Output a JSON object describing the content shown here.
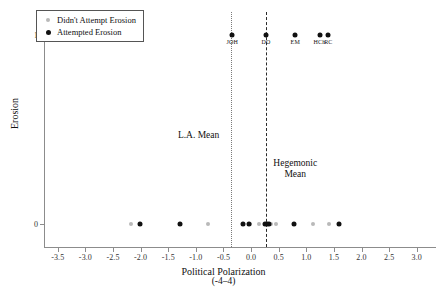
{
  "chart_data": {
    "type": "scatter",
    "title": "",
    "xlabel": "Political Polarization",
    "xlabel_sub": "(-4–4)",
    "ylabel": "Erosion",
    "xlim": [
      -3.75,
      3.15
    ],
    "ylim": [
      -0.12,
      1.12
    ],
    "grid": false,
    "xticks": [
      -3.5,
      -3.0,
      -2.5,
      -2.0,
      -1.5,
      -1.0,
      -0.5,
      0.0,
      0.5,
      1.0,
      1.5,
      2.0,
      2.5,
      3.0
    ],
    "xticklabels": [
      "-3.5",
      "-3.0",
      "-2.5",
      "-2.0",
      "-1.5",
      "-1.0",
      "-0.5",
      "0.0",
      "0.5",
      "1.0",
      "1.5",
      "2.0",
      "2.5",
      "3.0"
    ],
    "yticks": [
      0,
      1
    ],
    "yticklabels": [
      "0",
      "1"
    ],
    "legend_position": "upper-left",
    "series": [
      {
        "name": "Didn't Attempt Erosion",
        "marker": "small-gray-dot",
        "color": "#b9b9b9",
        "points": [
          {
            "x": -2.17,
            "y": 0
          },
          {
            "x": -0.78,
            "y": 0
          },
          {
            "x": -0.02,
            "y": 0
          },
          {
            "x": 0.15,
            "y": 0
          },
          {
            "x": 0.37,
            "y": 0
          },
          {
            "x": 0.46,
            "y": 0
          },
          {
            "x": 1.12,
            "y": 0
          },
          {
            "x": 1.42,
            "y": 0
          }
        ]
      },
      {
        "name": "Attempted Erosion",
        "marker": "black-dot",
        "color": "#111111",
        "points": [
          {
            "x": -2.02,
            "y": 0,
            "label": ""
          },
          {
            "x": -1.29,
            "y": 0,
            "label": ""
          },
          {
            "x": -0.15,
            "y": 0,
            "label": ""
          },
          {
            "x": -0.04,
            "y": 0,
            "label": ""
          },
          {
            "x": 0.25,
            "y": 0,
            "label": ""
          },
          {
            "x": 0.29,
            "y": 0,
            "label": ""
          },
          {
            "x": 0.32,
            "y": 0,
            "label": ""
          },
          {
            "x": 0.78,
            "y": 0,
            "label": ""
          },
          {
            "x": 1.59,
            "y": 0,
            "label": ""
          },
          {
            "x": -0.34,
            "y": 1,
            "label": "JOH"
          },
          {
            "x": 0.27,
            "y": 1,
            "label": "DO"
          },
          {
            "x": 0.8,
            "y": 1,
            "label": "EM"
          },
          {
            "x": 1.24,
            "y": 1,
            "label": "HCh"
          },
          {
            "x": 1.4,
            "y": 1,
            "label": "RC"
          }
        ]
      }
    ],
    "reference_lines": [
      {
        "name": "L.A. Mean",
        "x": -0.37,
        "style": "dotted",
        "color": "#7a7a7a",
        "annotation": "L.A. Mean",
        "annotation_x": -0.95,
        "annotation_y": 0.47
      },
      {
        "name": "Hegemonic Mean",
        "x": 0.27,
        "style": "dashed",
        "color": "#2a2a2a",
        "annotation": "Hegemonic\nMean",
        "annotation_line1": "Hegemonic",
        "annotation_line2": "Mean",
        "annotation_x": 0.8,
        "annotation_y": 0.29
      }
    ]
  },
  "legend": {
    "items": [
      {
        "label": "Didn't Attempt Erosion",
        "marker": "small-gray-dot"
      },
      {
        "label": "Attempted Erosion",
        "marker": "black-dot"
      }
    ]
  }
}
